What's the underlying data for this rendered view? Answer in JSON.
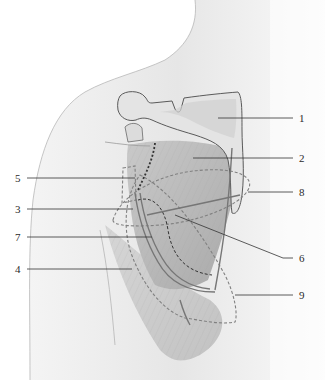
{
  "figure": {
    "type": "anatomical-illustration",
    "colors": {
      "skin": "#ececec",
      "skin_shadow": "#d8d8d8",
      "bone": "#e2e2e2",
      "bone_outline": "#6a6a6a",
      "muscle": "#bdbdbd",
      "muscle_dark": "#9a9a9a",
      "vessel": "#7a7a7a",
      "dashed_outline": "#7d7d7d",
      "dotted_line": "#333333",
      "leader_line": "#333333",
      "label_text": "#2a2a2a"
    }
  },
  "labels": [
    {
      "id": "1",
      "text": "1",
      "side": "right",
      "y": 118
    },
    {
      "id": "2",
      "text": "2",
      "side": "right",
      "y": 158
    },
    {
      "id": "8",
      "text": "8",
      "side": "right",
      "y": 192
    },
    {
      "id": "6",
      "text": "6",
      "side": "right",
      "y": 258
    },
    {
      "id": "9",
      "text": "9",
      "side": "right",
      "y": 295
    },
    {
      "id": "5",
      "text": "5",
      "side": "left",
      "y": 178
    },
    {
      "id": "3",
      "text": "3",
      "side": "left",
      "y": 209
    },
    {
      "id": "7",
      "text": "7",
      "side": "left",
      "y": 237
    },
    {
      "id": "4",
      "text": "4",
      "side": "left",
      "y": 269
    }
  ]
}
